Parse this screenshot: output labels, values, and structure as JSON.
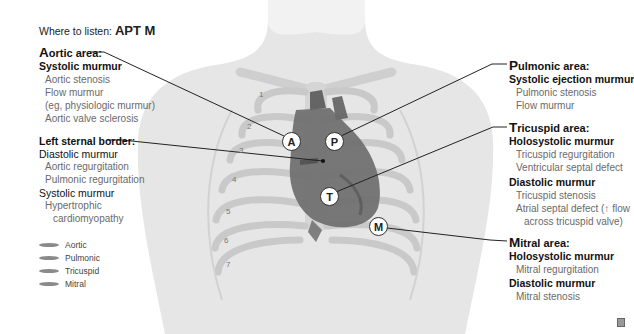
{
  "header": {
    "prefix": "Where to listen:",
    "mnemonic": "APT M"
  },
  "areas": {
    "aortic": {
      "cap": "A",
      "rest": "ortic area:",
      "groups": [
        {
          "murmur": "Systolic murmur",
          "items": [
            "Aortic stenosis",
            "Flow murmur",
            "(eg, physiologic murmur)",
            "Aortic valve sclerosis"
          ]
        }
      ]
    },
    "left_sternal": {
      "title": "Left sternal border:",
      "groups": [
        {
          "murmur": "Diastolic murmur",
          "items": [
            "Aortic regurgitation",
            "Pulmonic regurgitation"
          ]
        },
        {
          "murmur": "Systolic murmur",
          "items": [
            "Hypertrophic",
            "cardiomyopathy"
          ]
        }
      ]
    },
    "pulmonic": {
      "cap": "P",
      "rest": "ulmonic area:",
      "groups": [
        {
          "murmur": "Systolic ejection murmur",
          "items": [
            "Pulmonic stenosis",
            "Flow murmur"
          ]
        }
      ]
    },
    "tricuspid": {
      "cap": "T",
      "rest": "ricuspid area:",
      "groups": [
        {
          "murmur": "Holosystolic murmur",
          "items": [
            "Tricuspid regurgitation",
            "Ventricular septal defect"
          ]
        },
        {
          "murmur": "Diastolic murmur",
          "items": [
            "Tricuspid stenosis",
            "Atrial septal defect (↑ flow",
            "across tricuspid valve)"
          ]
        }
      ]
    },
    "mitral": {
      "cap": "M",
      "rest": "itral area:",
      "groups": [
        {
          "murmur": "Holosystolic murmur",
          "items": [
            "Mitral regurgitation"
          ]
        },
        {
          "murmur": "Diastolic murmur",
          "items": [
            "Mitral stenosis"
          ]
        }
      ]
    }
  },
  "legend": [
    {
      "label": "Aortic",
      "color": "#8a8a8a"
    },
    {
      "label": "Pulmonic",
      "color": "#8a8a8a"
    },
    {
      "label": "Tricuspid",
      "color": "#8a8a8a"
    },
    {
      "label": "Mitral",
      "color": "#8a8a8a"
    }
  ],
  "markers": {
    "A": "A",
    "P": "P",
    "T": "T",
    "M": "M"
  },
  "ribs": [
    "1",
    "2",
    "3",
    "4",
    "5",
    "6",
    "7"
  ]
}
